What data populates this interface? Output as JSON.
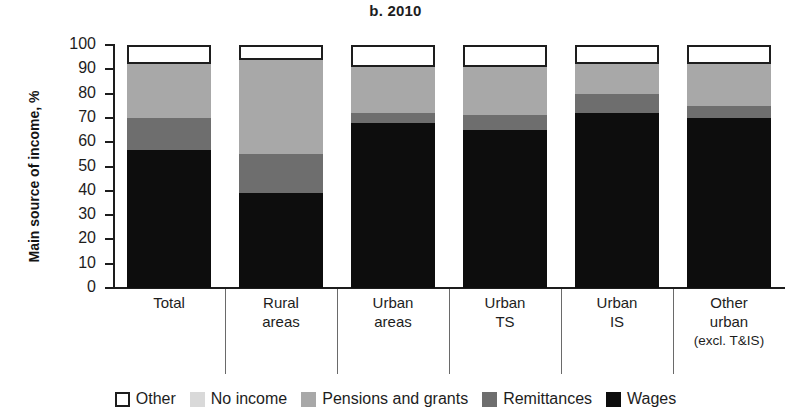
{
  "chart_data": {
    "type": "bar",
    "subtype": "stacked-bar-100",
    "title": "b. 2010",
    "xlabel": "",
    "ylabel": "Main source of income, %",
    "ylim": [
      0,
      100
    ],
    "ytick_step": 10,
    "yticks": [
      100,
      90,
      80,
      70,
      60,
      50,
      40,
      30,
      20,
      10,
      0
    ],
    "grid": false,
    "legend_position": "bottom",
    "categories": [
      "Total",
      "Rural areas",
      "Urban areas",
      "Urban TS",
      "Urban IS",
      "Other urban (excl. T&IS)"
    ],
    "category_lines": [
      [
        "Total"
      ],
      [
        "Rural",
        "areas"
      ],
      [
        "Urban",
        "areas"
      ],
      [
        "Urban",
        "TS"
      ],
      [
        "Urban",
        "IS"
      ],
      [
        "Other",
        "urban",
        "(excl. T&IS)"
      ]
    ],
    "series": [
      {
        "name": "Wages",
        "color": "#0d0d0d",
        "values": [
          57,
          39,
          68,
          65,
          72,
          70
        ]
      },
      {
        "name": "Remittances",
        "color": "#6e6e6e",
        "values": [
          13,
          16,
          4,
          6,
          8,
          5
        ]
      },
      {
        "name": "Pensions and grants",
        "color": "#a8a8a8",
        "values": [
          22,
          39,
          19,
          20,
          12,
          17
        ]
      },
      {
        "name": "No income",
        "color": "#d9d9d9",
        "values": [
          0,
          0,
          0,
          0,
          0,
          0
        ]
      },
      {
        "name": "Other",
        "color": "#ffffff",
        "values": [
          8,
          6,
          9,
          9,
          8,
          8
        ]
      }
    ],
    "cumulative_tops": [
      [
        57,
        70,
        92,
        92,
        100
      ],
      [
        39,
        55,
        94,
        94,
        100
      ],
      [
        68,
        72,
        91,
        91,
        100
      ],
      [
        65,
        71,
        91,
        91,
        100
      ],
      [
        72,
        80,
        92,
        92,
        100
      ],
      [
        70,
        75,
        92,
        92,
        100
      ]
    ]
  },
  "legend": {
    "items": [
      {
        "label": "Other",
        "swatch": "sw-other"
      },
      {
        "label": "No income",
        "swatch": "sw-noincome"
      },
      {
        "label": "Pensions and grants",
        "swatch": "sw-pensions"
      },
      {
        "label": "Remittances",
        "swatch": "sw-remittances"
      },
      {
        "label": "Wages",
        "swatch": "sw-wages"
      }
    ]
  }
}
